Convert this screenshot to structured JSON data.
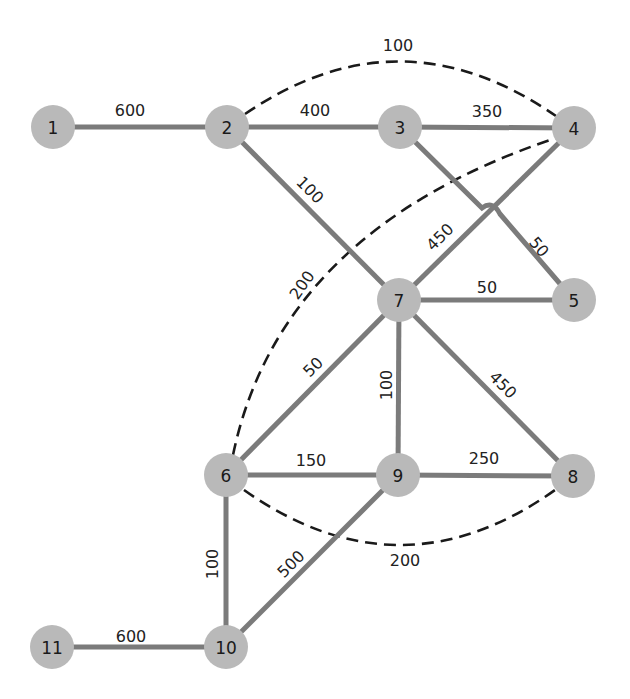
{
  "diagram": {
    "type": "weighted-network-graph",
    "colors": {
      "node_fill": "#b9b9b9",
      "edge_solid": "#7b7b7b",
      "edge_dashed": "#1a1a1a",
      "text": "#1a1a1a"
    },
    "nodes": [
      {
        "id": "1",
        "label": "1",
        "x": 53,
        "y": 127
      },
      {
        "id": "2",
        "label": "2",
        "x": 227,
        "y": 127
      },
      {
        "id": "3",
        "label": "3",
        "x": 400,
        "y": 127
      },
      {
        "id": "4",
        "label": "4",
        "x": 574,
        "y": 128
      },
      {
        "id": "5",
        "label": "5",
        "x": 574,
        "y": 300
      },
      {
        "id": "6",
        "label": "6",
        "x": 226,
        "y": 475
      },
      {
        "id": "7",
        "label": "7",
        "x": 399,
        "y": 300
      },
      {
        "id": "8",
        "label": "8",
        "x": 573,
        "y": 476
      },
      {
        "id": "9",
        "label": "9",
        "x": 398,
        "y": 475
      },
      {
        "id": "10",
        "label": "10",
        "x": 226,
        "y": 647
      },
      {
        "id": "11",
        "label": "11",
        "x": 52,
        "y": 647
      }
    ],
    "solid_edges": [
      {
        "from": "1",
        "to": "2",
        "weight": "600"
      },
      {
        "from": "2",
        "to": "3",
        "weight": "400"
      },
      {
        "from": "3",
        "to": "4",
        "weight": "350"
      },
      {
        "from": "2",
        "to": "7",
        "weight": "100"
      },
      {
        "from": "3",
        "to": "5",
        "weight": "50"
      },
      {
        "from": "4",
        "to": "7",
        "weight": "450"
      },
      {
        "from": "7",
        "to": "5",
        "weight": "50"
      },
      {
        "from": "7",
        "to": "8",
        "weight": "450"
      },
      {
        "from": "7",
        "to": "6",
        "weight": "50"
      },
      {
        "from": "7",
        "to": "9",
        "weight": "100"
      },
      {
        "from": "6",
        "to": "9",
        "weight": "150"
      },
      {
        "from": "9",
        "to": "8",
        "weight": "250"
      },
      {
        "from": "6",
        "to": "10",
        "weight": "100"
      },
      {
        "from": "9",
        "to": "10",
        "weight": "500"
      },
      {
        "from": "11",
        "to": "10",
        "weight": "600"
      }
    ],
    "dashed_edges": [
      {
        "from": "2",
        "to": "4",
        "weight": "100"
      },
      {
        "from": "6",
        "to": "4",
        "weight": "200"
      },
      {
        "from": "6",
        "to": "8",
        "weight": "200"
      }
    ]
  }
}
